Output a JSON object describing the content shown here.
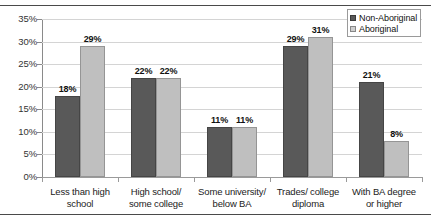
{
  "chart_data": {
    "type": "bar",
    "title": "",
    "xlabel": "",
    "ylabel": "",
    "ylim": [
      0,
      35
    ],
    "ytick_step": 5,
    "grid": true,
    "legend_position": "top-right",
    "categories": [
      "Less than high school",
      "High school/ some college",
      "Some university/ below BA",
      "Trades/ college diploma",
      "With BA degree or higher"
    ],
    "category_lines": [
      [
        "Less than high",
        "school"
      ],
      [
        "High school/",
        "some college"
      ],
      [
        "Some university/",
        "below BA"
      ],
      [
        "Trades/ college",
        "diploma"
      ],
      [
        "With BA degree",
        "or higher"
      ]
    ],
    "ytick_labels": [
      "35%",
      "30%",
      "25%",
      "20%",
      "15%",
      "10%",
      "5%",
      "0%"
    ],
    "ytick_values": [
      35,
      30,
      25,
      20,
      15,
      10,
      5,
      0
    ],
    "series": [
      {
        "name": "Non-Aboriginal",
        "color": "#595959",
        "values": [
          18,
          22,
          11,
          29,
          21
        ],
        "labels": [
          "18%",
          "22%",
          "11%",
          "29%",
          "21%"
        ]
      },
      {
        "name": "Aboriginal",
        "color": "#bfbfbf",
        "values": [
          29,
          22,
          11,
          31,
          8
        ],
        "labels": [
          "29%",
          "22%",
          "11%",
          "31%",
          "8%"
        ]
      }
    ]
  },
  "legend": {
    "items": [
      {
        "label": "Non-Aboriginal",
        "color": "#595959"
      },
      {
        "label": "Aboriginal",
        "color": "#cfcfcf"
      }
    ]
  }
}
